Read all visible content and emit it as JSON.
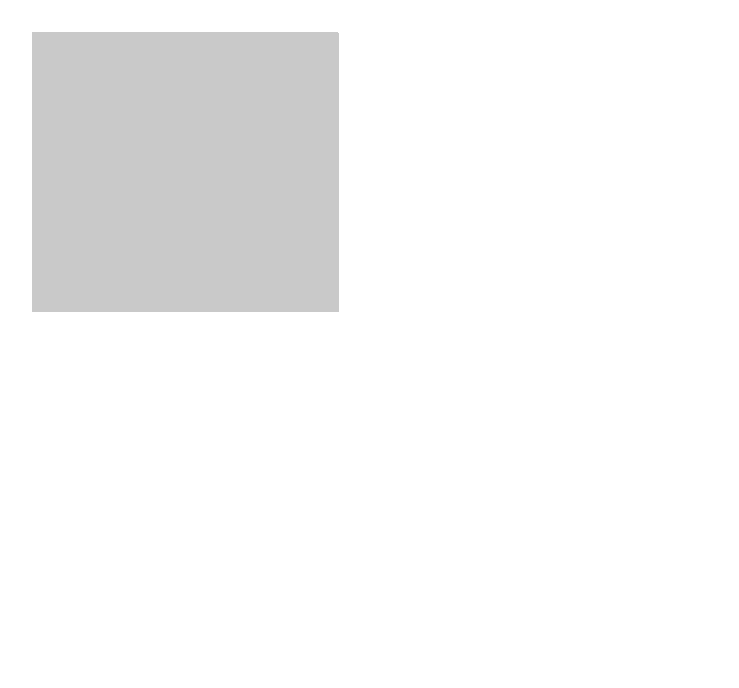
{
  "figure": {
    "type": "exploded-diagram",
    "colors": {
      "background": "#c9c9c9",
      "paper": "#ffffff",
      "tube_face": "#ffffff",
      "line": "#1a1a1a",
      "lens": "#8e8e8e",
      "lens_highlight": "#e6e6e6"
    },
    "callout": {
      "lines": [
        "Insert the smaller",
        "tube into the",
        "larger one"
      ]
    },
    "labels": {
      "eyepiece": "Eyepiece",
      "large_tube": [
        "Large",
        "tube"
      ],
      "objective_lens": [
        "Objective",
        "lens"
      ]
    },
    "parts": [
      {
        "id": "large-tube",
        "name": "Large tube"
      },
      {
        "id": "small-tube",
        "name": "Small tube"
      },
      {
        "id": "objective-lens",
        "name": "Objective lens"
      },
      {
        "id": "eyepiece",
        "name": "Eyepiece"
      }
    ]
  }
}
